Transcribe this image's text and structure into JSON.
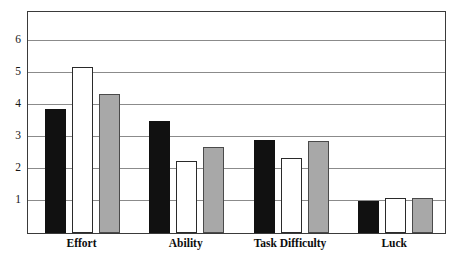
{
  "chart_data": {
    "type": "bar",
    "title": "",
    "subtitle": "",
    "xlabel": "",
    "ylabel": "",
    "categories": [
      "Effort",
      "Ability",
      "Task Difficulty",
      "Luck"
    ],
    "series": [
      {
        "name": "Series 1",
        "color": "#111111",
        "fill": "black",
        "values": [
          3.88,
          3.5,
          2.9,
          1.0
        ]
      },
      {
        "name": "Series 2",
        "color": "#ffffff",
        "fill": "white",
        "values": [
          5.17,
          2.25,
          2.35,
          1.08
        ]
      },
      {
        "name": "Series 3",
        "color": "#a8a8a8",
        "fill": "gray",
        "values": [
          4.35,
          2.7,
          2.88,
          1.09
        ]
      }
    ],
    "ylim": [
      0,
      6.9
    ],
    "yticks": [
      1,
      2,
      3,
      4,
      5,
      6
    ],
    "ytick_labels": [
      "1",
      "2",
      "3",
      "4",
      "5",
      "6"
    ],
    "grid": true,
    "grid_color": "#8b8b8b",
    "legend": "none",
    "frame": true,
    "frame_color": "#3a3a3a",
    "background": "#ffffff"
  },
  "axis": {
    "y_label_1": "1",
    "y_label_2": "2",
    "y_label_3": "3",
    "y_label_4": "4",
    "y_label_5": "5",
    "y_label_6": "6"
  },
  "categories": {
    "c0": "Effort",
    "c1": "Ability",
    "c2": "Task Difficulty",
    "c3": "Luck"
  }
}
